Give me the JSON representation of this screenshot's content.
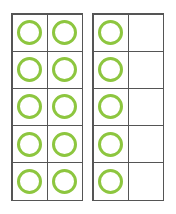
{
  "diagram": {
    "type": "ten-frames",
    "counter_color": "#8dc63f",
    "grid_color": "#555555",
    "frames": [
      {
        "rows": 5,
        "cols": 2,
        "filled": [
          [
            true,
            true
          ],
          [
            true,
            true
          ],
          [
            true,
            true
          ],
          [
            true,
            true
          ],
          [
            true,
            true
          ]
        ]
      },
      {
        "rows": 5,
        "cols": 2,
        "filled": [
          [
            true,
            false
          ],
          [
            true,
            false
          ],
          [
            true,
            false
          ],
          [
            true,
            false
          ],
          [
            true,
            false
          ]
        ]
      }
    ],
    "total_counters": 15
  }
}
